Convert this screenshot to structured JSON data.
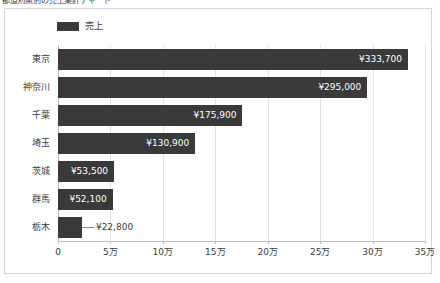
{
  "title": {
    "text": "都道府県別の売上集計チャート",
    "clipped": true
  },
  "legend": {
    "series_label": "売上",
    "swatch_color": "#3a3a3a",
    "position": "top-left"
  },
  "axis": {
    "x_ticks": [
      "0",
      "5万",
      "10万",
      "15万",
      "20万",
      "25万",
      "30万",
      "35万"
    ]
  },
  "colors": {
    "bar": "#3a3a3a",
    "gridline": "#e2e2e2",
    "axis": "#bfbfbf",
    "frame": "#d4d4d4",
    "label_light": "#ffffff",
    "label_dark": "#3c3c3c"
  },
  "chart_data": {
    "type": "bar",
    "orientation": "horizontal",
    "title": "都道府県別の売上集計チャート",
    "xlabel": "",
    "ylabel": "",
    "xlim": [
      0,
      350000
    ],
    "x_tick_values": [
      0,
      50000,
      100000,
      150000,
      200000,
      250000,
      300000,
      350000
    ],
    "x_tick_labels": [
      "0",
      "5万",
      "10万",
      "15万",
      "20万",
      "25万",
      "30万",
      "35万"
    ],
    "grid": "vertical",
    "legend_position": "top-left",
    "categories": [
      "東京",
      "神奈川",
      "千葉",
      "埼玉",
      "茨城",
      "群馬",
      "栃木"
    ],
    "series": [
      {
        "name": "売上",
        "color": "#3a3a3a",
        "values": [
          333700,
          295000,
          175900,
          130900,
          53500,
          52100,
          22800
        ],
        "value_labels": [
          "¥333,700",
          "¥295,000",
          "¥175,900",
          "¥130,900",
          "¥53,500",
          "¥52,100",
          "¥22,800"
        ],
        "label_placement": [
          "inside-end",
          "inside-end",
          "inside-end",
          "inside-end",
          "inside-end",
          "inside-end",
          "outside-end"
        ]
      }
    ]
  }
}
